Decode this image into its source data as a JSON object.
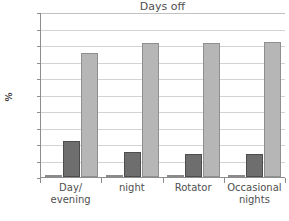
{
  "chart_data": {
    "type": "bar",
    "title": "Days off",
    "xlabel": "",
    "ylabel": "%",
    "ylim": [
      0,
      100
    ],
    "ytick_labels": [
      "100",
      "90",
      "80",
      "70",
      "60",
      "50",
      "40",
      "30",
      "20",
      "10",
      "0"
    ],
    "ytick_values": [
      100,
      90,
      80,
      70,
      60,
      50,
      40,
      30,
      20,
      10,
      0
    ],
    "grid": true,
    "legend": false,
    "legend_position": "none",
    "categories": [
      "Day/evening",
      "night",
      "Rotator",
      "Occasional nights"
    ],
    "category_lines": [
      [
        "Day/",
        "evening"
      ],
      [
        "night"
      ],
      [
        "Rotator"
      ],
      [
        "Occasional",
        "nights"
      ]
    ],
    "series": [
      {
        "name": "series-1",
        "color": "#ffffff",
        "values": [
          1,
          1,
          1.5,
          1
        ]
      },
      {
        "name": "series-2",
        "color": "#6e6e6e",
        "values": [
          22,
          15,
          14,
          14
        ]
      },
      {
        "name": "series-3",
        "color": "#b6b6b6",
        "values": [
          75,
          81,
          81,
          82
        ]
      }
    ]
  },
  "axis": {
    "y_title": "%"
  },
  "colors": {
    "gridline": "#d3d3d3",
    "axis": "#8d8d8d",
    "text": "#4f4f4f",
    "series_light": "#ffffff",
    "series_dark": "#6e6e6e",
    "series_mid": "#b6b6b6"
  }
}
